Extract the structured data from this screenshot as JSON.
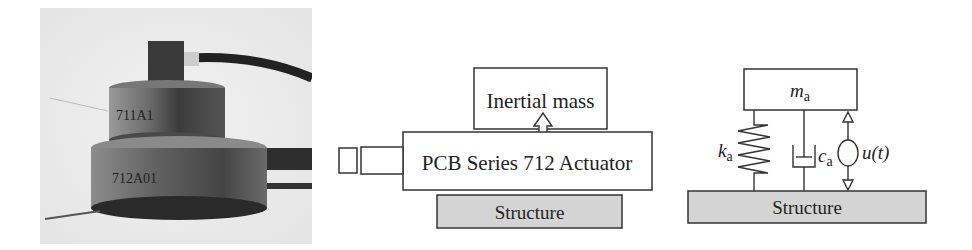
{
  "photo": {
    "label": "Photograph of PCB actuator",
    "engraving_top": "711A1",
    "engraving_bottom": "712A01"
  },
  "schematic": {
    "inertial_mass_label": "Inertial mass",
    "actuator_label": "PCB Series 712 Actuator",
    "structure_label": "Structure"
  },
  "model": {
    "mass_symbol": "m",
    "mass_subscript": "a",
    "stiffness_symbol": "k",
    "stiffness_subscript": "a",
    "damping_symbol": "c",
    "damping_subscript": "a",
    "force_label": "u(t)",
    "structure_label": "Structure"
  },
  "colors": {
    "structure_fill": "#d4d4d4",
    "line": "#333333"
  }
}
